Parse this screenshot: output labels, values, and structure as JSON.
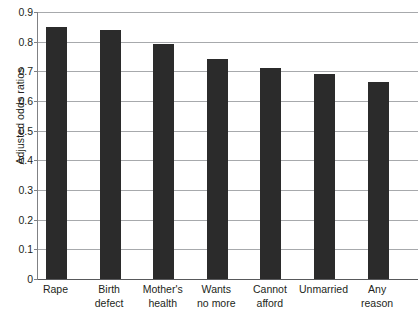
{
  "chart_data": {
    "type": "bar",
    "title": "",
    "xlabel": "",
    "ylabel": "Adjusted odds ratios",
    "categories": [
      "Rape",
      "Birth defect",
      "Mother's health",
      "Wants no more",
      "Cannot afford",
      "Unmarried",
      "Any reason"
    ],
    "category_lines": [
      [
        "Rape"
      ],
      [
        "Birth",
        "defect"
      ],
      [
        "Mother's",
        "health"
      ],
      [
        "Wants",
        "no more"
      ],
      [
        "Cannot",
        "afford"
      ],
      [
        "Unmarried"
      ],
      [
        "Any",
        "reason"
      ]
    ],
    "values": [
      0.85,
      0.838,
      0.793,
      0.742,
      0.712,
      0.691,
      0.663
    ],
    "ylim": [
      0,
      0.9
    ],
    "ytick_labels": [
      "0.9",
      "0.8",
      "0.7",
      "0.6",
      "0.5",
      "0.4",
      "0.3",
      "0.2",
      "0.1",
      "0"
    ],
    "ytick_values": [
      0.9,
      0.8,
      0.7,
      0.6,
      0.5,
      0.4,
      0.3,
      0.2,
      0.1,
      0
    ],
    "grid": true,
    "legend": "none",
    "bar_color": "#2b2b2b",
    "gridline_color": "#a7a9ac",
    "axis_color": "#808184",
    "background": "#ffffff"
  }
}
